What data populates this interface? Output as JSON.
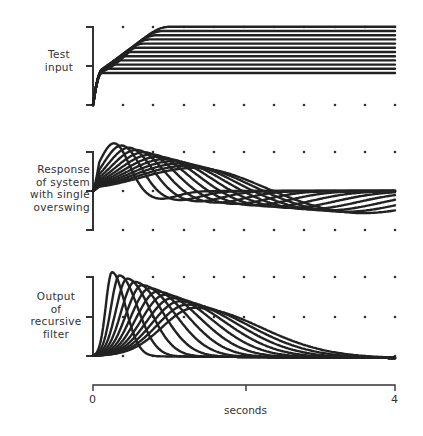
{
  "chart_data": [
    {
      "type": "line",
      "title": "Test input",
      "description": "Family of smoothed step inputs with increasing rise times and settling levels",
      "xlabel": "seconds",
      "xlim": [
        0,
        4
      ],
      "ylim": [
        0,
        2
      ],
      "grid": "dots",
      "series_count": 12,
      "series": [
        {
          "name": "input-1",
          "x": [
            0,
            0.1,
            0.2,
            0.4,
            4
          ],
          "values": [
            0,
            0.6,
            0.85,
            0.9,
            0.9
          ]
        },
        {
          "name": "input-6",
          "x": [
            0,
            0.2,
            0.5,
            1.0,
            4
          ],
          "values": [
            0,
            0.5,
            1.0,
            1.3,
            1.3
          ]
        },
        {
          "name": "input-12",
          "x": [
            0,
            0.3,
            0.8,
            1.6,
            4
          ],
          "values": [
            0,
            0.6,
            1.3,
            2.0,
            2.0
          ]
        }
      ]
    },
    {
      "type": "line",
      "title": "Response of system with single overswing",
      "xlabel": "seconds",
      "xlim": [
        0,
        4
      ],
      "ylim": [
        -1,
        1
      ],
      "grid": "dots",
      "series_count": 12,
      "series": [
        {
          "name": "response-fast",
          "x": [
            0,
            0.1,
            0.3,
            0.6,
            1.0,
            1.5,
            4
          ],
          "values": [
            0,
            0.2,
            1.4,
            0.2,
            -0.3,
            -0.05,
            0
          ]
        },
        {
          "name": "response-slow",
          "x": [
            0,
            0.2,
            0.6,
            1.2,
            1.8,
            2.5,
            4
          ],
          "values": [
            0,
            0.2,
            0.9,
            0.0,
            -0.55,
            -0.1,
            0
          ]
        }
      ]
    },
    {
      "type": "line",
      "title": "Output of recursive filter",
      "xlabel": "seconds",
      "xlim": [
        0,
        4
      ],
      "ylim": [
        0,
        2
      ],
      "grid": "dots",
      "series_count": 12,
      "series": [
        {
          "name": "output-fast",
          "x": [
            0,
            0.1,
            0.25,
            0.6,
            1.0,
            4
          ],
          "values": [
            0,
            0.4,
            2.0,
            0.1,
            0,
            0
          ]
        },
        {
          "name": "output-slow",
          "x": [
            0,
            0.3,
            1.1,
            1.6,
            2.0,
            4
          ],
          "values": [
            0,
            0.4,
            1.0,
            0.5,
            0,
            0
          ]
        }
      ]
    }
  ],
  "labels": {
    "panel1": [
      "Test",
      "input"
    ],
    "panel2": [
      "Response",
      "of system",
      "with single",
      "overswing"
    ],
    "panel3": [
      "Output",
      "of",
      "recursive",
      "filter"
    ]
  },
  "axis": {
    "start": "0",
    "end": "4",
    "label": "seconds"
  }
}
